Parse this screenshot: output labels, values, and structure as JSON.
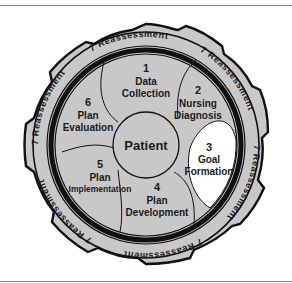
{
  "diagram": {
    "center": {
      "label": "Patient"
    },
    "steps": [
      {
        "number": "1",
        "line1": "Data",
        "line2": "Collection"
      },
      {
        "number": "2",
        "line1": "Nursing",
        "line2": "Diagnosis"
      },
      {
        "number": "3",
        "line1": "Goal",
        "line2": "Formation"
      },
      {
        "number": "4",
        "line1": "Plan",
        "line2": "Development"
      },
      {
        "number": "5",
        "line1": "Plan",
        "line2": "Implementation"
      },
      {
        "number": "6",
        "line1": "Plan",
        "line2": "Evaluation"
      }
    ],
    "outer_ring": {
      "number": "7",
      "label": "Reassessment",
      "segments": [
        {
          "text": "7 Reassessment"
        },
        {
          "text": "7 Reassessment"
        },
        {
          "text": "7 Reassessment"
        },
        {
          "text": "7 Reassessment"
        },
        {
          "text": "7 Reassessment"
        },
        {
          "text": "7 Reassessment"
        }
      ]
    },
    "colors": {
      "fill": "#c8c8c8",
      "highlight": "#ffffff",
      "stroke": "#111111"
    }
  }
}
